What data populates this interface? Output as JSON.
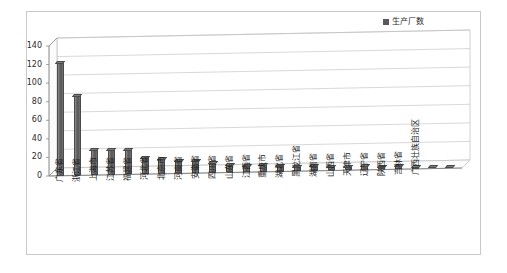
{
  "legend": {
    "series_label": "生产厂数",
    "marker_color": "#595959",
    "position": "top-right"
  },
  "axis": {
    "y_ticks": [
      "0",
      "20",
      "40",
      "60",
      "80",
      "100",
      "120",
      "140"
    ]
  },
  "chart_data": {
    "type": "bar",
    "title": "",
    "subtitle": "",
    "xlabel": "",
    "ylabel": "",
    "ylim": [
      0,
      140
    ],
    "ytick_step": 20,
    "grid": true,
    "legend_position": "top-right",
    "style": "3d-column",
    "series": [
      {
        "name": "生产厂数",
        "color": "#595959",
        "values": [
          123,
          87,
          28,
          28,
          27,
          19,
          17,
          15,
          14,
          12,
          9,
          8,
          8,
          7,
          6,
          6,
          5,
          5,
          5,
          4,
          4,
          3,
          3,
          2
        ]
      }
    ],
    "categories": [
      "广东省",
      "浙江省",
      "上海市",
      "江苏省",
      "福建省",
      "河北省",
      "北京市",
      "河南省",
      "安徽省",
      "四川省",
      "山东省",
      "江西省",
      "重庆市",
      "湖北省",
      "黑龙江省",
      "湖南省",
      "山西省",
      "天津市",
      "辽宁省",
      "陕西省",
      "吉林省",
      "广西壮族自治区",
      "",
      ""
    ]
  }
}
